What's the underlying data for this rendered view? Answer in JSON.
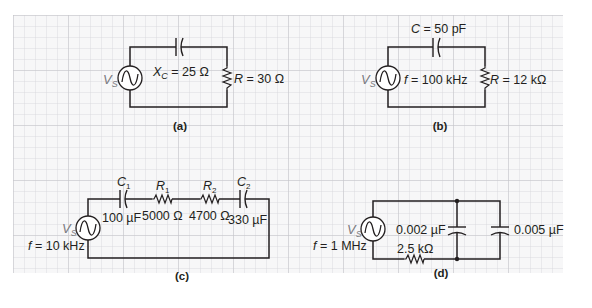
{
  "figure": {
    "background": "#ffffff",
    "grid": {
      "color_minor": "#d3d3d6",
      "color_major": "#c2c2c6",
      "spacing_px": 11
    },
    "wire_color": "#231f20",
    "source_label_color": "#7a7a80"
  },
  "circuits": {
    "a": {
      "caption": "(a)",
      "source": {
        "symbol": "V",
        "subscript": "S"
      },
      "capacitor": {
        "name": "X",
        "subscript": "C",
        "value": " = 25 Ω"
      },
      "resistor": {
        "name": "R",
        "value": " = 30 Ω"
      }
    },
    "b": {
      "caption": "(b)",
      "source": {
        "symbol": "V",
        "subscript": "S"
      },
      "frequency": {
        "name": "f",
        "value": " = 100 kHz"
      },
      "capacitor": {
        "name": "C",
        "value": " = 50 pF"
      },
      "resistor": {
        "name": "R",
        "value": " = 12 kΩ"
      }
    },
    "c": {
      "caption": "(c)",
      "source": {
        "symbol": "V",
        "subscript": "S"
      },
      "frequency": {
        "name": "f",
        "value": " = 10 kHz"
      },
      "c1": {
        "name": "C",
        "subscript": "1",
        "value": "100 µF"
      },
      "r1": {
        "name": "R",
        "subscript": "1",
        "value": "5000 Ω"
      },
      "r2": {
        "name": "R",
        "subscript": "2",
        "value": "4700 Ω"
      },
      "c2": {
        "name": "C",
        "subscript": "2",
        "value": "330 µF"
      }
    },
    "d": {
      "caption": "(d)",
      "source": {
        "symbol": "V",
        "subscript": "S"
      },
      "frequency": {
        "name": "f",
        "value": " = 1 MHz"
      },
      "resistor": {
        "value": "2.5 kΩ"
      },
      "c1": {
        "value": "0.002 µF"
      },
      "c2": {
        "value": "0.005 µF"
      }
    }
  }
}
